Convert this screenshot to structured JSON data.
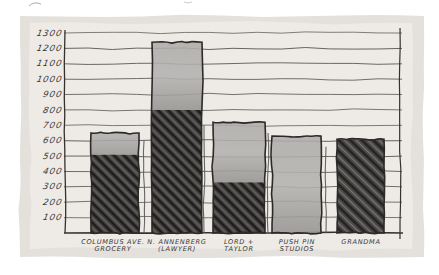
{
  "palette": {
    "page_bg": "#ffffff",
    "paper_bg": "#e4e1dc",
    "plot_bg": "#eeebe6",
    "outline_ink": "#2b2a28",
    "pencil_line": "#5a5856",
    "axis_ink": "#343230",
    "label_ink": "#3a3835",
    "wash_light": "#b4b2b0",
    "wash_dark": "#9b9997",
    "hatch_base": "#454341",
    "hatch_dark": "#1d1c1b",
    "hatch_light": "#716f6c"
  },
  "chart_data": {
    "type": "bar",
    "title": "",
    "xlabel": "",
    "ylabel": "",
    "ylim": [
      0,
      1300
    ],
    "y_ticks": [
      1300,
      1200,
      1100,
      1000,
      900,
      800,
      700,
      600,
      500,
      400,
      300,
      200,
      100
    ],
    "grid": true,
    "legend": false,
    "style": "hand-drawn-pencil-and-wash",
    "categories": [
      "Columbus Ave. Grocery",
      "N. Annenberg (Lawyer)",
      "Lord + Taylor",
      "Push Pin Studios",
      "Grandma"
    ],
    "values": [
      650,
      1240,
      720,
      630,
      610
    ],
    "bars": [
      {
        "name": "columbus-ave-grocery",
        "label_lines": [
          "COLUMBUS AVE.",
          "GROCERY"
        ],
        "value": 650,
        "segments": [
          {
            "style": "hatch",
            "from": 0,
            "to": 510
          },
          {
            "style": "wash",
            "from": 510,
            "to": 650
          }
        ]
      },
      {
        "name": "n-annenberg-lawyer",
        "label_lines": [
          "N. ANNENBERG",
          "(LAWYER)"
        ],
        "value": 1240,
        "segments": [
          {
            "style": "hatch",
            "from": 0,
            "to": 800
          },
          {
            "style": "wash",
            "from": 800,
            "to": 1240
          }
        ]
      },
      {
        "name": "lord-and-taylor",
        "label_lines": [
          "LORD +",
          "TAYLOR"
        ],
        "value": 720,
        "segments": [
          {
            "style": "hatch",
            "from": 0,
            "to": 330
          },
          {
            "style": "wash",
            "from": 330,
            "to": 720
          }
        ]
      },
      {
        "name": "push-pin-studios",
        "label_lines": [
          "PUSH PIN",
          "STUDIOS"
        ],
        "value": 630,
        "segments": [
          {
            "style": "wash",
            "from": 0,
            "to": 630
          }
        ]
      },
      {
        "name": "grandma",
        "label_lines": [
          "GRANDMA"
        ],
        "value": 610,
        "segments": [
          {
            "style": "hatch",
            "from": 0,
            "to": 610
          }
        ]
      }
    ]
  },
  "layout_hints": {
    "canvas": {
      "width": 439,
      "height": 275
    },
    "paper": {
      "x": 20,
      "y": 16,
      "w": 404,
      "h": 241
    },
    "inner": {
      "x": 30,
      "y": 23,
      "w": 382,
      "h": 226
    },
    "plot": {
      "left": 65,
      "right": 400,
      "top": 30,
      "bottom": 233,
      "y_of_max": 33
    },
    "bars_px": [
      {
        "x": 91,
        "w": 48
      },
      {
        "x": 152,
        "w": 50
      },
      {
        "x": 213,
        "w": 52
      },
      {
        "x": 272,
        "w": 49
      },
      {
        "x": 337,
        "w": 47
      }
    ],
    "label_centers": [
      113,
      177,
      239,
      297,
      361
    ],
    "separators": [
      {
        "x": 144,
        "top_value": 600
      },
      {
        "x": 204,
        "top_value": 700
      },
      {
        "x": 268,
        "top_value": 650
      },
      {
        "x": 326,
        "top_value": 560
      }
    ]
  }
}
